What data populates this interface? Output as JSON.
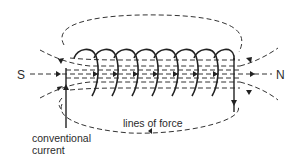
{
  "diagram": {
    "labels": {
      "south_pole": "S",
      "north_pole": "N",
      "field_lines": "lines of force",
      "current_line1": "conventional",
      "current_line2": "current"
    },
    "coil": {
      "turns": 8
    },
    "colors": {
      "background": "#ffffff",
      "ink": "#222222",
      "text": "#2b2b2b"
    }
  }
}
